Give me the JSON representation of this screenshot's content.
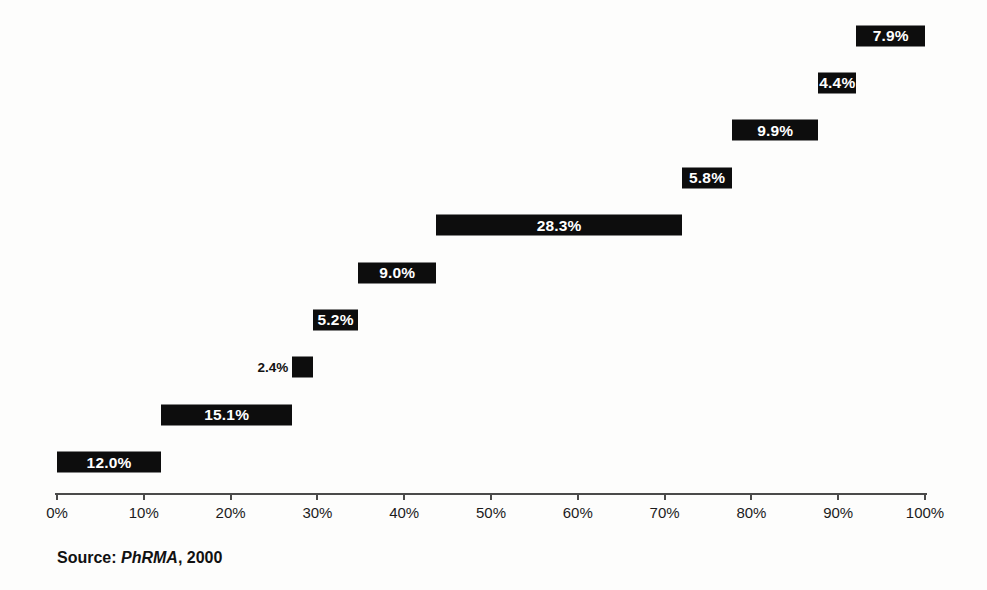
{
  "chart_data": {
    "type": "bar",
    "subtype": "horizontal-waterfall",
    "title": "",
    "xlabel": "",
    "ylabel": "",
    "xlim": [
      0,
      100
    ],
    "x_ticks": [
      "0%",
      "10%",
      "20%",
      "30%",
      "40%",
      "50%",
      "60%",
      "70%",
      "80%",
      "90%",
      "100%"
    ],
    "grid": false,
    "legend": false,
    "bar_color": "#0d0d0d",
    "bar_value_color": "#ffffff",
    "label_color": "#121212",
    "bars": [
      {
        "label": "Other",
        "value": 7.9,
        "start": 92.1,
        "value_label": "7.9%",
        "label_side": "left",
        "value_placement": "inside"
      },
      {
        "label": "Regulatory: IND and NDA",
        "value": 4.4,
        "start": 87.7,
        "value_label": "4.4%",
        "label_side": "left",
        "value_placement": "inside"
      },
      {
        "label": "Process development for manufacturing and quality control",
        "value": 9.9,
        "start": 77.8,
        "value_label": "9.9%",
        "label_side": "left",
        "value_placement": "inside"
      },
      {
        "label": "Clinical evaluation phase IV",
        "value": 5.8,
        "start": 72.0,
        "value_label": "5.8%",
        "label_side": "left",
        "value_placement": "inside"
      },
      {
        "label": "Clinical evaluation: phases I, II und III",
        "value": 28.3,
        "start": 43.7,
        "value_label": "28.3%",
        "label_side": "left",
        "value_placement": "inside"
      },
      {
        "label": "Pharmaceutical dosage formulation and stability",
        "value": 9.0,
        "start": 34.7,
        "value_label": "9.0%",
        "label_side": "right",
        "value_placement": "inside"
      },
      {
        "label": "Toxicology and safety testing",
        "value": 5.2,
        "start": 29.5,
        "value_label": "5.2%",
        "label_side": "right",
        "value_placement": "inside"
      },
      {
        "label": "Bioavailability",
        "value": 2.4,
        "start": 27.1,
        "value_label": "2.4%",
        "label_side": "right",
        "value_placement": "outside-left"
      },
      {
        "label": "Biological screening and pharmacological testing",
        "value": 15.1,
        "start": 12.0,
        "value_label": "15.1%",
        "label_side": "right",
        "value_placement": "inside"
      },
      {
        "label": "Synthesis and extraction",
        "value": 12.0,
        "start": 0.0,
        "value_label": "12.0%",
        "label_side": "right",
        "value_placement": "inside"
      }
    ],
    "source": {
      "prefix": "Source: ",
      "name": "PhRMA",
      "suffix": ", 2000"
    }
  }
}
